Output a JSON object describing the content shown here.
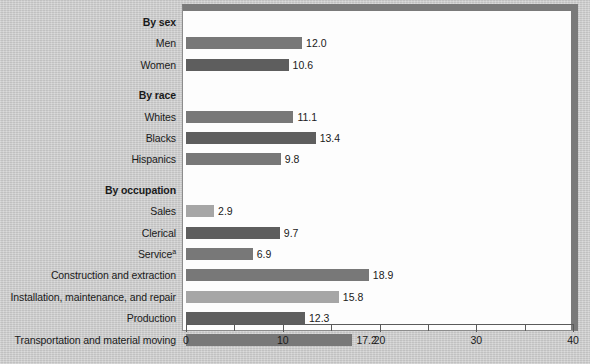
{
  "chart_data": {
    "type": "bar",
    "orientation": "horizontal",
    "title": "",
    "subtitle": "",
    "xlabel": "",
    "ylabel": "",
    "xlim": [
      0,
      40
    ],
    "grid": false,
    "legend": null,
    "xticks": [
      0,
      10,
      20,
      30,
      40
    ],
    "xtick_labels": [
      "0",
      "10",
      "20",
      "30",
      "40"
    ],
    "minor_xticks": [
      5,
      15,
      25,
      35
    ],
    "footnote": "a",
    "groups": [
      {
        "name": "By sex",
        "categories": [
          "Men",
          "Women"
        ],
        "values": [
          12.0,
          10.6
        ],
        "value_labels": [
          "12.0",
          "10.6"
        ],
        "shades": [
          "mid",
          "dark"
        ]
      },
      {
        "name": "By race",
        "categories": [
          "Whites",
          "Blacks",
          "Hispanics"
        ],
        "values": [
          11.1,
          13.4,
          9.8
        ],
        "value_labels": [
          "11.1",
          "13.4",
          "9.8"
        ],
        "shades": [
          "mid",
          "dark",
          "mid"
        ]
      },
      {
        "name": "By occupation",
        "categories": [
          "Sales",
          "Clerical",
          "Service",
          "Construction and extraction",
          "Installation, maintenance, and repair",
          "Production",
          "Transportation and material moving"
        ],
        "category_superscripts": [
          "",
          "",
          "a",
          "",
          "",
          "",
          ""
        ],
        "values": [
          2.9,
          9.7,
          6.9,
          18.9,
          15.8,
          12.3,
          17.2
        ],
        "value_labels": [
          "2.9",
          "9.7",
          "6.9",
          "18.9",
          "15.8",
          "12.3",
          "17.2"
        ],
        "shades": [
          "light",
          "dark",
          "mid",
          "mid",
          "light",
          "dark",
          "mid"
        ]
      },
      {
        "name": "By sector",
        "categories": [
          "Private wage and salary",
          "Government"
        ],
        "values": [
          6.6,
          35.9
        ],
        "value_labels": [
          "6.6",
          "35.9"
        ],
        "shades": [
          "mid",
          "dark"
        ]
      }
    ],
    "colors": {
      "bar_dark": "#5e5e5e",
      "bar_mid": "#787878",
      "bar_light": "#a6a6a6",
      "plot_background": "#fdfdfd",
      "page_background": "#c9c9c9",
      "frame": "#7a7a7a",
      "text": "#1a1a1a"
    }
  }
}
